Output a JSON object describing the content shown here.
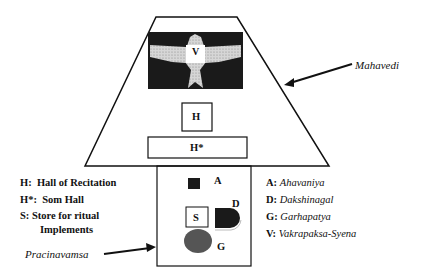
{
  "diagram": {
    "callouts": {
      "mahavedi": "Mahavedi",
      "pracinavamsa": "Pracinavamsa"
    },
    "markers": {
      "V": "V",
      "H": "H",
      "H_star": "H*",
      "A": "A",
      "S": "S",
      "D": "D",
      "G": "G"
    },
    "left_legend": [
      {
        "key": "H:",
        "text": "Hall of Recitation"
      },
      {
        "key": "H*:",
        "text": "Som Hall"
      },
      {
        "key": "S:",
        "text": "Store for ritual"
      },
      {
        "key": "",
        "text": "Implements"
      }
    ],
    "right_legend": [
      {
        "key": "A:",
        "text": "Ahavaniya"
      },
      {
        "key": "D:",
        "text": "Dakshinagal"
      },
      {
        "key": "G:",
        "text": "Garhapatya"
      },
      {
        "key": "V:",
        "text": "Vakrapaksa-Syena"
      }
    ],
    "colors": {
      "line": "#111111",
      "fill_dark": "#1a1a1a",
      "bird": "#c8c8c8",
      "garhapatya": "#555555"
    }
  }
}
